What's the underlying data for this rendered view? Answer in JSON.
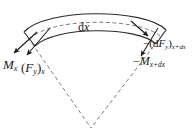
{
  "figure": {
    "type": "mechanics-free-body-diagram",
    "background_color": "#ffffff",
    "line_color": "#2b2b2b",
    "dashed_color": "#6e6e6e",
    "canvas": {
      "width": 194,
      "height": 134
    }
  },
  "labels": {
    "arc_length": {
      "symbol_d": "d",
      "symbol_x": "x",
      "full": "dx"
    },
    "moment_left": {
      "symbol": "M",
      "sub": "x",
      "full": "Mx"
    },
    "shear_left": {
      "open": "(",
      "symbol": "F",
      "sub_inner": "y",
      "close": ")",
      "sub_outer": "x",
      "full": "(Fy)x"
    },
    "shear_right": {
      "sign": "−",
      "open": "(",
      "d": "d",
      "symbol": "F",
      "sub_inner": "y",
      "close": ")",
      "sub_outer": "x+dx",
      "full": "-(dFy)x+dx"
    },
    "moment_right": {
      "sign": "−",
      "symbol": "M",
      "sub": "x+dx",
      "full": "-Mx+dx"
    }
  },
  "geometry": {
    "arc_outer_description": "outer arc of annular sector",
    "arc_inner_description": "inner arc of annular sector",
    "centerline_description": "dashed mid-surface arc labelled dx",
    "radial_lines_description": "dashed radii converging to apex",
    "apex": {
      "x": 91,
      "y": 128
    },
    "arrows": [
      {
        "name": "moment-left-arrow",
        "from": [
          36,
          33
        ],
        "to": [
          13,
          54
        ]
      },
      {
        "name": "shear-left-arrow",
        "from": [
          49,
          29
        ],
        "to": [
          26,
          56
        ]
      },
      {
        "name": "shear-right-arrow",
        "from": [
          132,
          22
        ],
        "to": [
          148,
          35
        ]
      },
      {
        "name": "moment-right-arrow",
        "from": [
          157,
          29
        ],
        "to": [
          140,
          56
        ]
      }
    ]
  }
}
